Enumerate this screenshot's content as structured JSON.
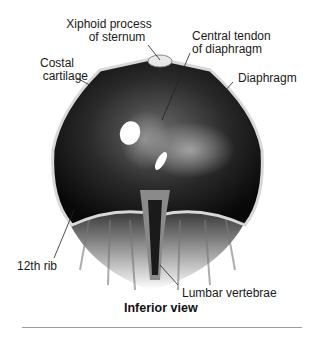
{
  "figure": {
    "view_caption": "Inferior view",
    "labels": {
      "xiphoid": [
        "Xiphoid process",
        "of sternum"
      ],
      "central_tendon": [
        "Central tendon",
        "of diaphragm"
      ],
      "costal": [
        "Costal",
        "cartilage"
      ],
      "diaphragm": "Diaphragm",
      "rib12": "12th rib",
      "lumbar": "Lumbar vertebrae"
    }
  }
}
